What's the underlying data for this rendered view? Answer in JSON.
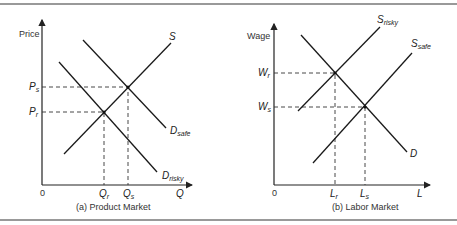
{
  "panels": {
    "a": {
      "caption": "(a) Product Market",
      "y_axis_label": "Price",
      "x_axis_label": "Q",
      "origin": "0",
      "supply_label": "S",
      "demand_safe": {
        "main": "D",
        "sub": "safe"
      },
      "demand_risky": {
        "main": "D",
        "sub": "risky"
      },
      "price_safe": {
        "main": "P",
        "sub": "s"
      },
      "price_risky": {
        "main": "P",
        "sub": "r"
      },
      "qty_risky": {
        "main": "Q",
        "sub": "r"
      },
      "qty_safe": {
        "main": "Q",
        "sub": "s"
      }
    },
    "b": {
      "caption": "(b) Labor Market",
      "y_axis_label": "Wage",
      "x_axis_label": "L",
      "origin": "0",
      "supply_risky": {
        "main": "S",
        "sub": "risky"
      },
      "supply_safe": {
        "main": "S",
        "sub": "safe"
      },
      "demand_label": "D",
      "wage_risky": {
        "main": "W",
        "sub": "r"
      },
      "wage_safe": {
        "main": "W",
        "sub": "s"
      },
      "labor_risky": {
        "main": "L",
        "sub": "r"
      },
      "labor_safe": {
        "main": "L",
        "sub": "s"
      }
    }
  }
}
